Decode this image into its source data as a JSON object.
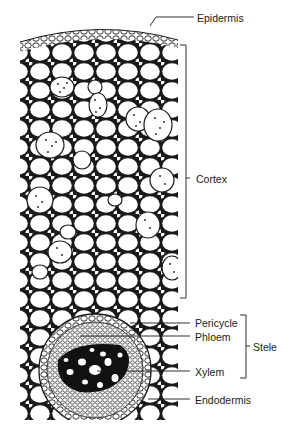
{
  "diagram": {
    "labels": {
      "epidermis": "Epidermis",
      "cortex": "Cortex",
      "pericycle": "Pericycle",
      "phloem": "Phloem",
      "xylem": "Xylem",
      "endodermis": "Endodermis",
      "stele": "Stele"
    },
    "colors": {
      "line": "#1a1a1a",
      "background": "#ffffff",
      "xylem_fill": "#111111"
    }
  }
}
